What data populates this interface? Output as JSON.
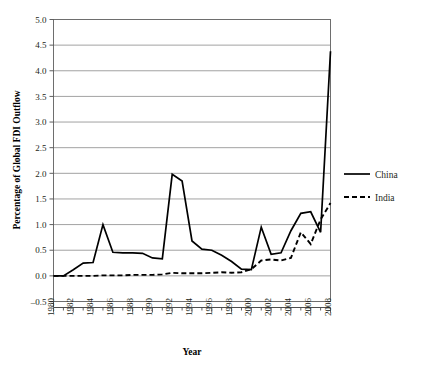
{
  "chart_data": {
    "type": "line",
    "title": "",
    "xlabel": "Year",
    "ylabel": "Percentage of Global FDI Outflow",
    "ylim": [
      -0.5,
      5.0
    ],
    "ytick_step": 0.5,
    "yticks": [
      "5.0",
      "4.5",
      "4.0",
      "3.5",
      "3.0",
      "2.5",
      "2.0",
      "1.5",
      "1.0",
      "0.5",
      "0.0",
      "-0.5"
    ],
    "ytick_values": [
      5.0,
      4.5,
      4.0,
      3.5,
      3.0,
      2.5,
      2.0,
      1.5,
      1.0,
      0.5,
      0.0,
      -0.5
    ],
    "grid": true,
    "grid_axis": "y",
    "legend_position": "right",
    "xlim": [
      1980,
      2008
    ],
    "x": [
      1980,
      1981,
      1982,
      1983,
      1984,
      1985,
      1986,
      1987,
      1988,
      1989,
      1990,
      1991,
      1992,
      1993,
      1994,
      1995,
      1996,
      1997,
      1998,
      1999,
      2000,
      2001,
      2002,
      2003,
      2004,
      2005,
      2006,
      2007,
      2008
    ],
    "xticks": [
      "1980",
      "1982",
      "1984",
      "1986",
      "1988",
      "1990",
      "1992",
      "1994",
      "1996",
      "1998",
      "2000",
      "2002",
      "2004",
      "2006",
      "2008"
    ],
    "xtick_values": [
      1980,
      1982,
      1984,
      1986,
      1988,
      1990,
      1992,
      1994,
      1996,
      1998,
      2000,
      2002,
      2004,
      2006,
      2008
    ],
    "series": [
      {
        "name": "China",
        "style": "solid",
        "color": "#000000",
        "values": [
          0.0,
          0.0,
          0.12,
          0.25,
          0.26,
          1.0,
          0.46,
          0.45,
          0.45,
          0.44,
          0.35,
          0.33,
          1.98,
          1.85,
          0.68,
          0.52,
          0.5,
          0.4,
          0.28,
          0.13,
          0.12,
          0.95,
          0.42,
          0.45,
          0.88,
          1.22,
          1.25,
          0.85,
          4.38
        ]
      },
      {
        "name": "India",
        "style": "dashed",
        "color": "#000000",
        "values": [
          0.0,
          0.0,
          0.0,
          0.0,
          0.0,
          0.01,
          0.01,
          0.01,
          0.02,
          0.02,
          0.02,
          0.03,
          0.06,
          0.05,
          0.05,
          0.05,
          0.06,
          0.07,
          0.06,
          0.07,
          0.13,
          0.3,
          0.32,
          0.3,
          0.35,
          0.85,
          0.62,
          1.1,
          1.42
        ]
      }
    ]
  },
  "legend": {
    "items": [
      {
        "label": "China"
      },
      {
        "label": "India"
      }
    ]
  }
}
